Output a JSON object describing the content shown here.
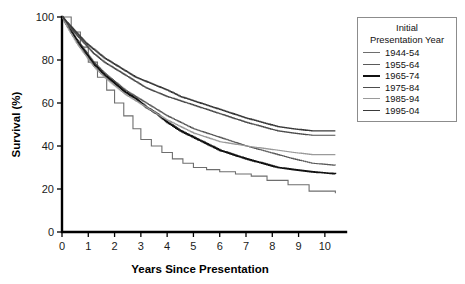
{
  "chart_data": {
    "type": "line",
    "subtype": "kaplan-meier-survival-step",
    "title": "",
    "xlabel": "Years Since Presentation",
    "ylabel": "Survival (%)",
    "xlim": [
      0,
      10.5
    ],
    "ylim": [
      0,
      100
    ],
    "xticks": [
      0,
      1,
      2,
      3,
      4,
      5,
      6,
      7,
      8,
      9,
      10
    ],
    "yticks": [
      0,
      20,
      40,
      60,
      80,
      100
    ],
    "xtick_labels": [
      "0",
      "1",
      "2",
      "3",
      "4",
      "5",
      "6",
      "7",
      "8",
      "9",
      "10"
    ],
    "ytick_labels": [
      "0",
      "20",
      "40",
      "60",
      "80",
      "100"
    ],
    "grid": false,
    "legend_position": "upper-right-outside",
    "legend_title": "Initial Presentation Year",
    "series": [
      {
        "name": "1944-54",
        "color": "#6e6e6e",
        "width": 1.1,
        "x": [
          0,
          0.35,
          0.7,
          1.0,
          1.35,
          1.7,
          2.0,
          2.35,
          2.7,
          3.0,
          3.4,
          3.8,
          4.2,
          4.6,
          5.0,
          5.5,
          6.0,
          6.6,
          7.2,
          7.8,
          8.6,
          9.4,
          10.4
        ],
        "y": [
          100,
          93,
          86,
          79,
          72,
          66,
          60,
          54,
          48,
          43,
          40,
          37,
          34,
          32,
          30,
          29,
          28,
          27,
          26,
          24,
          22,
          19,
          18
        ]
      },
      {
        "name": "1955-64",
        "color": "#5a5a5a",
        "width": 1.1,
        "x": [
          0,
          0.3,
          0.6,
          0.9,
          1.2,
          1.6,
          2.0,
          2.4,
          2.8,
          3.2,
          3.6,
          4.0,
          4.5,
          5.0,
          5.5,
          6.0,
          6.5,
          7.0,
          7.6,
          8.2,
          8.8,
          9.5,
          10.4
        ],
        "y": [
          100,
          94,
          89,
          84,
          79,
          74,
          70,
          66,
          63,
          60,
          57,
          54,
          51,
          48,
          46,
          44,
          42,
          40,
          38,
          36,
          34,
          32,
          31
        ]
      },
      {
        "name": "1965-74",
        "color": "#111111",
        "width": 1.7,
        "x": [
          0,
          0.3,
          0.6,
          0.9,
          1.2,
          1.6,
          2.0,
          2.4,
          2.8,
          3.2,
          3.6,
          4.0,
          4.5,
          5.0,
          5.5,
          6.0,
          6.5,
          7.0,
          7.6,
          8.2,
          8.8,
          9.5,
          10.4
        ],
        "y": [
          100,
          94,
          88,
          83,
          78,
          73,
          69,
          65,
          62,
          58,
          55,
          51,
          47,
          44,
          41,
          38,
          36,
          34,
          32,
          30,
          29,
          28,
          27
        ]
      },
      {
        "name": "1975-84",
        "color": "#4d4d4d",
        "width": 1.2,
        "x": [
          0,
          0.3,
          0.6,
          0.9,
          1.2,
          1.6,
          2.0,
          2.4,
          2.8,
          3.2,
          3.6,
          4.0,
          4.5,
          5.0,
          5.5,
          6.0,
          6.5,
          7.0,
          7.6,
          8.2,
          8.8,
          9.5,
          10.4
        ],
        "y": [
          100,
          95,
          91,
          87,
          83,
          79,
          76,
          73,
          70,
          67,
          65,
          63,
          61,
          59,
          57,
          55,
          53,
          51,
          49,
          47,
          46,
          45,
          45
        ]
      },
      {
        "name": "1985-94",
        "color": "#9a9a9a",
        "width": 1.1,
        "x": [
          0,
          0.3,
          0.6,
          0.9,
          1.2,
          1.6,
          2.0,
          2.4,
          2.8,
          3.2,
          3.6,
          4.0,
          4.5,
          5.0,
          5.5,
          6.0,
          6.5,
          7.0,
          7.6,
          8.2,
          8.8,
          9.5,
          10.4
        ],
        "y": [
          100,
          93,
          87,
          82,
          77,
          72,
          68,
          64,
          61,
          58,
          55,
          52,
          49,
          46,
          44,
          42,
          41,
          40,
          39,
          38,
          37,
          36,
          36
        ]
      },
      {
        "name": "1995-04",
        "color": "#3a3a3a",
        "width": 1.3,
        "x": [
          0,
          0.3,
          0.6,
          0.9,
          1.2,
          1.6,
          2.0,
          2.4,
          2.8,
          3.2,
          3.6,
          4.0,
          4.5,
          5.0,
          5.5,
          6.0,
          6.5,
          7.0,
          7.6,
          8.2,
          8.8,
          9.5,
          10.4
        ],
        "y": [
          100,
          96,
          92,
          88,
          85,
          81,
          78,
          75,
          72,
          70,
          68,
          66,
          63,
          61,
          59,
          57,
          55,
          53,
          51,
          49,
          48,
          47,
          47
        ]
      }
    ]
  },
  "legend": {
    "title_line1": "Initial",
    "title_line2": "Presentation Year"
  }
}
